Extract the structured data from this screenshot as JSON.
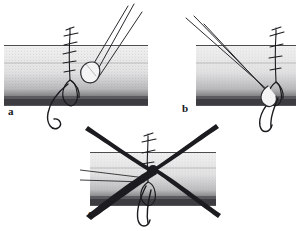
{
  "figure": {
    "background_color": "#ffffff",
    "ink_color": "#1b1b1f",
    "tissue_fill_light": "#e9e9ea",
    "tissue_fill_dark": "#4a4a4c",
    "width": 296,
    "height": 231
  },
  "panels": [
    {
      "id": "a",
      "label": "a",
      "label_x": 8,
      "label_y": 113,
      "caption_role": "correct-step-one",
      "crossed_out": false,
      "description": "Tissue block with vertical suture line and knot; instrument tip approaches from upper right; thread tail curves below tissue",
      "instrument": {
        "name": "forceps-shaft",
        "approach": "upper-right",
        "line_count": 3
      },
      "tissue": {
        "x": 4,
        "y": 44,
        "width": 144,
        "height": 62
      },
      "suture": {
        "stitch_count": 5,
        "knot_visible": true,
        "thread_tail": "below-left"
      }
    },
    {
      "id": "b",
      "label": "b",
      "label_x": 182,
      "label_y": 110,
      "caption_role": "correct-step-two",
      "crossed_out": false,
      "description": "Tissue block with suture line at right; instrument tines angle in from upper left converging at knot; thread loop hangs below",
      "instrument": {
        "name": "forceps-shaft",
        "approach": "upper-left",
        "line_count": 3
      },
      "tissue": {
        "x": 196,
        "y": 44,
        "width": 100,
        "height": 62
      },
      "suture": {
        "stitch_count": 4,
        "knot_visible": true,
        "thread_tail": "below-loop"
      }
    },
    {
      "id": "c",
      "label": "c",
      "label_x": 88,
      "label_y": 214,
      "caption_role": "incorrect-step",
      "crossed_out": true,
      "cross_out_marker": "large-X",
      "cross_out_stroke_count": 4,
      "description": "Tissue block with suture and thin instrument entering from left, struck through by a large X indicating an incorrect manoeuvre",
      "instrument": {
        "name": "needle-holder-shaft",
        "approach": "left-horizontal",
        "line_count": 2
      },
      "tissue": {
        "x": 90,
        "y": 152,
        "width": 126,
        "height": 54
      },
      "suture": {
        "stitch_count": 4,
        "knot_visible": true,
        "thread_tail": "below-double"
      }
    }
  ],
  "icons": {
    "cross_out": "x-cross-icon",
    "forceps": "forceps-icon",
    "suture": "suture-thread-icon",
    "tissue": "tissue-block-icon"
  }
}
